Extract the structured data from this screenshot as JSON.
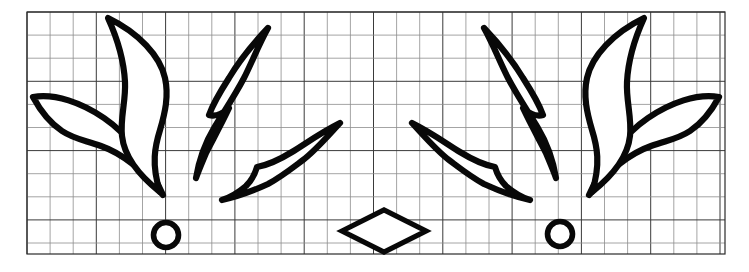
{
  "document": {
    "title": "Graph Paper Leaf Motif Drawing",
    "kind": "scanned-line-drawing",
    "width": 749,
    "height": 272,
    "background_color": "#ffffff"
  },
  "grid": {
    "name": "graph-paper-grid",
    "left": 27,
    "top": 12,
    "right": 725,
    "bottom": 254,
    "cell_size": 23.1,
    "columns": 30,
    "rows": 10,
    "minor_line_color": "#8d8d8d",
    "major_line_color": "#3a3a3a",
    "major_every": 3,
    "border_color": "#2a2a2a",
    "visible": true
  },
  "ink": {
    "stroke_color": "#080808",
    "fill_color": "#ffffff",
    "leaf_stroke_width": 6.2,
    "circle_stroke_width": 5.6,
    "diamond_stroke_width": 5.2
  },
  "composition": {
    "description": "Two mirrored fans of four pointed leaf shapes, each fan accompanied by a small circle, with a single diamond centered between them.",
    "symmetry": "bilateral-vertical",
    "mirror_axis_x": 376,
    "leaf_count": 8,
    "circle_count": 2,
    "diamond_count": 1
  },
  "shapes": {
    "leaves": [
      {
        "id": "leaf-left-outer",
        "name": "leaf-left-outer",
        "group": "left-fan",
        "orientation": "down-right",
        "tip_start": [
          33,
          97
        ],
        "tip_end": [
          163,
          195
        ],
        "path": "M 33 97 C 55 93 82 103 104 118 C 126 133 146 157 163 195 C 140 166 118 152 101 146 C 84 140 74 139 62 131 C 50 123 40 110 33 97 Z"
      },
      {
        "id": "leaf-left-upper",
        "name": "leaf-left-upper",
        "group": "left-fan",
        "orientation": "up-vertical",
        "tip_start": [
          108,
          18
        ],
        "tip_end": [
          160,
          192
        ],
        "path": "M 108 18 C 118 40 124 62 125 82 C 126 101 120 118 122 136 C 124 154 136 173 160 192 C 151 164 155 146 160 130 C 165 113 169 96 165 78 C 160 56 139 33 108 18 Z"
      },
      {
        "id": "leaf-left-inner",
        "name": "leaf-left-inner",
        "group": "left-fan",
        "orientation": "up-right",
        "tip_start": [
          196,
          178
        ],
        "tip_end": [
          268,
          28
        ],
        "path": "M 196 178 C 199 160 205 143 214 128 C 223 113 234 97 244 78 C 253 60 259 44 268 28 C 250 47 238 63 229 78 C 220 92 213 104 209 115 C 215 117 222 114 229 108 C 220 127 212 141 206 153 C 201 165 198 172 196 178 Z"
      },
      {
        "id": "leaf-left-lower-right",
        "name": "leaf-left-lower-right",
        "group": "left-fan",
        "orientation": "up-right-shallow",
        "tip_start": [
          222,
          200
        ],
        "tip_end": [
          340,
          123
        ],
        "path": "M 222 200 C 240 196 255 190 268 184 C 281 177 291 169 303 160 C 315 151 327 137 340 123 C 320 133 305 144 292 152 C 279 160 268 165 257 167 C 255 174 252 180 246 186 C 239 192 231 197 222 200 Z"
      },
      {
        "id": "leaf-right-outer",
        "name": "leaf-right-outer",
        "group": "right-fan",
        "orientation": "down-left",
        "tip_start": [
          719,
          97
        ],
        "tip_end": [
          589,
          195
        ],
        "path": "M 719 97 C 697 93 670 103 648 118 C 626 133 606 157 589 195 C 612 166 634 152 651 146 C 668 140 678 139 690 131 C 702 123 712 110 719 97 Z"
      },
      {
        "id": "leaf-right-upper",
        "name": "leaf-right-upper",
        "group": "right-fan",
        "orientation": "up-vertical",
        "tip_start": [
          644,
          18
        ],
        "tip_end": [
          592,
          192
        ],
        "path": "M 644 18 C 634 40 628 62 627 82 C 626 101 632 118 630 136 C 628 154 616 173 592 192 C 601 164 597 146 592 130 C 587 113 583 96 587 78 C 592 56 613 33 644 18 Z"
      },
      {
        "id": "leaf-right-inner",
        "name": "leaf-right-inner",
        "group": "right-fan",
        "orientation": "up-left",
        "tip_start": [
          556,
          178
        ],
        "tip_end": [
          484,
          28
        ],
        "path": "M 556 178 C 553 160 547 143 538 128 C 529 113 518 97 508 78 C 499 60 493 44 484 28 C 502 47 514 63 523 78 C 532 92 539 104 543 115 C 537 117 530 114 523 108 C 532 127 540 141 546 153 C 551 165 554 172 556 178 Z"
      },
      {
        "id": "leaf-right-lower-left",
        "name": "leaf-right-lower-left",
        "group": "right-fan",
        "orientation": "up-left-shallow",
        "tip_start": [
          530,
          200
        ],
        "tip_end": [
          412,
          123
        ],
        "path": "M 530 200 C 512 196 497 190 484 184 C 471 177 461 169 449 160 C 437 151 425 137 412 123 C 432 133 447 144 460 152 C 473 160 484 165 495 167 C 497 174 500 180 506 186 C 513 192 521 197 530 200 Z"
      }
    ],
    "circles": [
      {
        "id": "circle-left",
        "name": "circle-left",
        "center_x": 166,
        "center_y": 235,
        "radius": 12.5
      },
      {
        "id": "circle-right",
        "name": "circle-right",
        "center_x": 560,
        "center_y": 234,
        "radius": 12.5
      }
    ],
    "diamond": {
      "id": "diamond-center",
      "name": "diamond-center",
      "center_x": 384,
      "center_y": 231,
      "half_width": 42,
      "half_height": 21,
      "points": "342,231 384,210 426,231 384,252"
    }
  }
}
